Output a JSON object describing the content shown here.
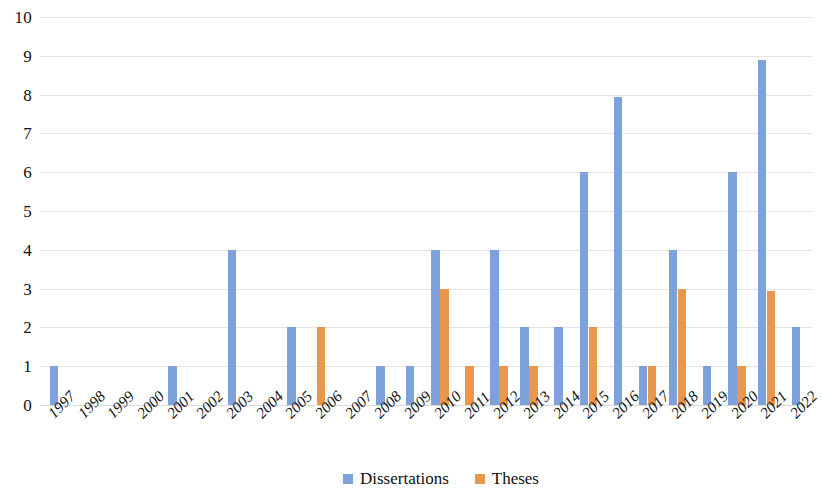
{
  "chart_data": {
    "type": "bar",
    "title": "",
    "subtitle": "",
    "xlabel": "",
    "ylabel": "",
    "ylim": [
      0,
      10
    ],
    "ytick_step": 1,
    "ytick_labels": [
      "0",
      "1",
      "2",
      "3",
      "4",
      "5",
      "6",
      "7",
      "8",
      "9",
      "10"
    ],
    "grid": true,
    "grid_axis": "y",
    "legend_position": "bottom-center",
    "bar_mode": "grouped",
    "categories": [
      "1997",
      "1998",
      "1999",
      "2000",
      "2001",
      "2002",
      "2003",
      "2004",
      "2005",
      "2006",
      "2007",
      "2008",
      "2009",
      "2010",
      "2011",
      "2012",
      "2013",
      "2014",
      "2015",
      "2016",
      "2017",
      "2018",
      "2019",
      "2020",
      "2021",
      "2022"
    ],
    "series": [
      {
        "name": "Dissertations",
        "color": "#7da1db",
        "values": [
          1,
          0,
          0,
          0,
          1,
          0,
          4,
          0,
          2,
          0,
          0,
          1,
          1,
          4,
          0,
          4,
          2,
          2,
          6,
          7.95,
          1,
          4,
          1,
          6,
          8.9,
          2
        ]
      },
      {
        "name": "Theses",
        "color": "#e8974c",
        "values": [
          0,
          0,
          0,
          0,
          0,
          0,
          0,
          0,
          0,
          2,
          0,
          0,
          0,
          3,
          1,
          1,
          1,
          0,
          2,
          0,
          1,
          3,
          0,
          1,
          2.95,
          0
        ]
      }
    ]
  },
  "colors": {
    "dissertations": "#7da1db",
    "theses": "#e8974c",
    "gridline": "#e3e3e8",
    "text": "#111111",
    "background": "#ffffff"
  },
  "legend": {
    "items": [
      {
        "label": "Dissertations",
        "color": "#7da1db"
      },
      {
        "label": "Theses",
        "color": "#e8974c"
      }
    ]
  }
}
